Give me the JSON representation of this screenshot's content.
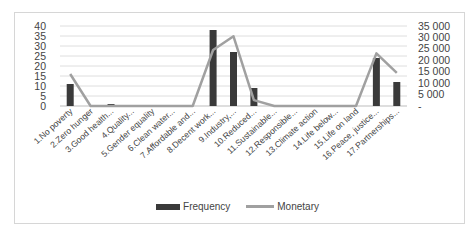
{
  "chart_data": {
    "type": "bar+line",
    "title": "",
    "categories": [
      "1.No poverty",
      "2.Zero hunger",
      "3.Good health...",
      "4.Quality...",
      "5.Gender equality",
      "6.Clean water...",
      "7.Affordable and...",
      "8.Decent work...",
      "9.Industry,...",
      "10.Reduced...",
      "11.Sustainable...",
      "12.Responsible...",
      "13.Climate action",
      "14.Life below...",
      "15.Life on land",
      "16.Peace, justice...",
      "17.Partnerships..."
    ],
    "series": [
      {
        "name": "Frequency",
        "type": "bar",
        "axis": "left",
        "color": "#3a3a3a",
        "values": [
          11,
          0,
          1,
          0,
          0,
          0,
          0,
          38,
          27,
          9,
          0,
          0,
          0,
          0,
          0,
          24,
          12
        ]
      },
      {
        "name": "Monetary",
        "type": "line",
        "axis": "right",
        "color": "#a0a0a0",
        "values": [
          14000,
          0,
          0,
          0,
          0,
          0,
          0,
          24500,
          30500,
          2600,
          0,
          0,
          0,
          0,
          0,
          23000,
          14500
        ]
      }
    ],
    "left_axis": {
      "ticks": [
        "0",
        "5",
        "10",
        "15",
        "20",
        "25",
        "30",
        "35",
        "40"
      ],
      "ylim": [
        0,
        40
      ]
    },
    "right_axis": {
      "ticks": [
        "-",
        "5 000",
        "10 000",
        "15 000",
        "20 000",
        "25 000",
        "30 000",
        "35 000"
      ],
      "ylim": [
        0,
        35000
      ]
    },
    "grid": true,
    "legend_position": "bottom",
    "legend": [
      "Frequency",
      "Monetary"
    ]
  }
}
